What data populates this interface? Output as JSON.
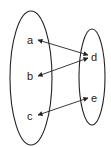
{
  "diagram": {
    "type": "mapping",
    "sets": [
      {
        "id": "left",
        "elements": [
          "a",
          "b",
          "c"
        ]
      },
      {
        "id": "right",
        "elements": [
          "d",
          "e"
        ]
      }
    ],
    "labels": {
      "a": "a",
      "b": "b",
      "c": "c",
      "d": "d",
      "e": "e"
    },
    "relations": [
      {
        "from": "a",
        "to": "d",
        "direction": "bidirectional"
      },
      {
        "from": "b",
        "to": "d",
        "direction": "bidirectional"
      },
      {
        "from": "c",
        "to": "e",
        "direction": "bidirectional"
      }
    ],
    "colors": {
      "stroke": "#222222",
      "background": "#ffffff"
    }
  }
}
